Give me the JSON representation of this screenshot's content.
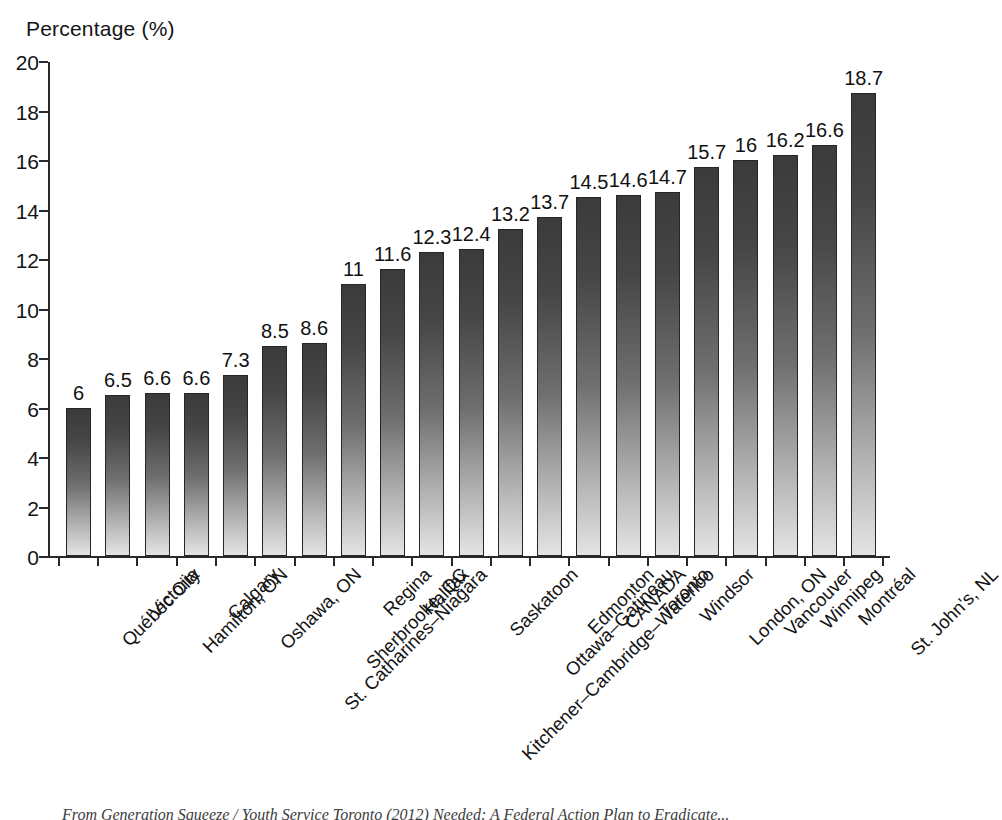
{
  "chart_data": {
    "type": "bar",
    "title": "",
    "xlabel": "",
    "ylabel": "Percentage (%)",
    "ylim": [
      0,
      20
    ],
    "yticks": [
      0,
      2,
      4,
      6,
      8,
      10,
      12,
      14,
      16,
      18,
      20
    ],
    "ytick_labels": [
      "0",
      "2",
      "4",
      "6",
      "8",
      "10",
      "12",
      "14",
      "16",
      "18",
      "20"
    ],
    "grid": false,
    "legend": null,
    "categories": [
      "Québec City",
      "Victoria",
      "Hamilton, ON",
      "Calgary",
      "Oshawa, ON",
      "St. Catharines–Niagara",
      "Sherbrooke, QC",
      "Regina",
      "Halifax",
      "Kitchener–Cambridge–Waterloo",
      "Saskatoon",
      "Ottawa–Gatineau",
      "Edmonton",
      "CANADA",
      "Toronto",
      "Windsor",
      "London, ON",
      "Vancouver",
      "Winnipeg",
      "Montréal",
      "St. John's, NL"
    ],
    "values": [
      6,
      6.5,
      6.6,
      6.6,
      7.3,
      8.5,
      8.6,
      11,
      11.6,
      12.3,
      12.4,
      13.2,
      13.7,
      14.5,
      14.6,
      14.7,
      15.7,
      16,
      16.2,
      16.6,
      18.7
    ],
    "value_labels": [
      "6",
      "6.5",
      "6.6",
      "6.6",
      "7.3",
      "8.5",
      "8.6",
      "11",
      "11.6",
      "12.3",
      "12.4",
      "13.2",
      "13.7",
      "14.5",
      "14.6",
      "14.7",
      "15.7",
      "16",
      "16.2",
      "16.6",
      "18.7"
    ],
    "bar_gradient": {
      "top": "#3b3b3b",
      "bottom": "#e4e4e4",
      "border": "#262626"
    },
    "axis_color": "#2a2a2a",
    "background": "#ffffff"
  },
  "source": {
    "text": "From Generation Squeeze / Youth Service Toronto (2012) Needed: A Federal Action Plan to Eradicate..."
  }
}
